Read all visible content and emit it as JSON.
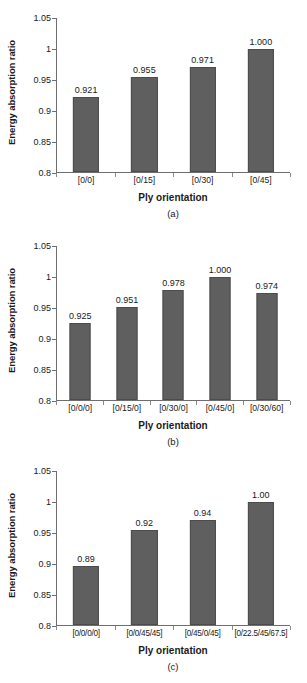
{
  "figure": {
    "background": "#ffffff",
    "bar_color": "#5f5f5f",
    "axis_color": "#6e6e6e",
    "text_color": "#1a1a1a"
  },
  "chart_data": [
    {
      "type": "bar",
      "panel": "a",
      "caption": "(a)",
      "title": "",
      "xlabel": "Ply orientation",
      "ylabel": "Energy absorption ratio",
      "ylim": [
        0.8,
        1.05
      ],
      "yticks": [
        0.8,
        0.85,
        0.9,
        0.95,
        1,
        1.05
      ],
      "ytick_labels": [
        "0.8",
        "0.85",
        "0.9",
        "0.95",
        "1",
        "1.05"
      ],
      "grid": false,
      "legend": "none",
      "categories": [
        "[0/0]",
        "[0/15]",
        "[0/30]",
        "[0/45]"
      ],
      "values": [
        0.921,
        0.955,
        0.971,
        1.0
      ],
      "data_labels": [
        "0.921",
        "0.955",
        "0.971",
        "1.000"
      ]
    },
    {
      "type": "bar",
      "panel": "b",
      "caption": "(b)",
      "title": "",
      "xlabel": "Ply orientation",
      "ylabel": "Energy absorption ratio",
      "ylim": [
        0.8,
        1.05
      ],
      "yticks": [
        0.8,
        0.85,
        0.9,
        0.95,
        1,
        1.05
      ],
      "ytick_labels": [
        "0.8",
        "0.85",
        "0.9",
        "0.95",
        "1",
        "1.05"
      ],
      "grid": false,
      "legend": "none",
      "categories": [
        "[0/0/0]",
        "[0/15/0]",
        "[0/30/0]",
        "[0/45/0]",
        "[0/30/60]"
      ],
      "values": [
        0.925,
        0.951,
        0.978,
        1.0,
        0.974
      ],
      "data_labels": [
        "0.925",
        "0.951",
        "0.978",
        "1.000",
        "0.974"
      ]
    },
    {
      "type": "bar",
      "panel": "c",
      "caption": "(c)",
      "title": "",
      "xlabel": "Ply orientation",
      "ylabel": "Energy absorption ratio",
      "ylim": [
        0.8,
        1.05
      ],
      "yticks": [
        0.8,
        0.85,
        0.9,
        0.95,
        1,
        1.05
      ],
      "ytick_labels": [
        "0.8",
        "0.85",
        "0.9",
        "0.95",
        "1",
        "1.05"
      ],
      "grid": false,
      "legend": "none",
      "categories": [
        "[0/0/0/0]",
        "[0/0/45/45]",
        "[0/45/0/45]",
        "[0/22.5/45/67.5]"
      ],
      "values": [
        0.895,
        0.954,
        0.971,
        1.0
      ],
      "data_labels": [
        "0.89",
        "0.92",
        "0.94",
        "1.00"
      ]
    }
  ]
}
